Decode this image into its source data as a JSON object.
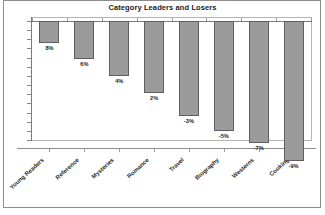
{
  "chart_data": {
    "type": "bar",
    "title": "Category Leaders and Losers",
    "xlabel": "",
    "ylabel": "",
    "grid": false,
    "legend": false,
    "orientation": "vertical",
    "categories": [
      "Young Readers",
      "Reference",
      "Mysteries",
      "Romance",
      "Travel",
      "Biography",
      "Westerns",
      "Cooking"
    ],
    "values": [
      8,
      6,
      4,
      2,
      -3,
      -5,
      -7,
      -9
    ],
    "data_labels": [
      "8%",
      "6%",
      "4%",
      "2%",
      "-3%",
      "-5%",
      "-7%",
      "-9%"
    ],
    "bar_depths_px": [
      22,
      38,
      55,
      72,
      95,
      110,
      122,
      140
    ],
    "ylim": [
      -10,
      0
    ],
    "y_tick_count": 14,
    "axis_labels_visible": false,
    "colors": {
      "bar_fill": "#9b9b9b",
      "bar_outline": "#5f5f5f",
      "plot_background": "#ffffff",
      "plot_border": "#b4b4b4",
      "axis": "#7a7a7a",
      "text": "#1b1b1b",
      "outer_frame": "#8d8d8d"
    }
  }
}
